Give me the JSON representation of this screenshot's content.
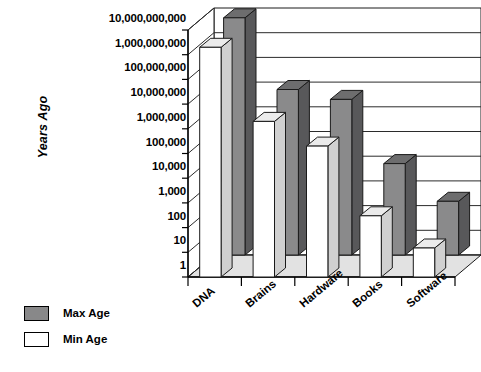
{
  "chart_data": {
    "type": "bar",
    "title": "",
    "subtitle": "",
    "xlabel": "",
    "ylabel": "Years Ago",
    "categories": [
      "DNA",
      "Brains",
      "Hardware",
      "Books",
      "Software"
    ],
    "series": [
      {
        "name": "Max Age",
        "color": "#888889",
        "values": [
          4000000000,
          5000000,
          2000000,
          5000,
          150
        ]
      },
      {
        "name": "Min Age",
        "color": "#ffffff",
        "values": [
          2000000000,
          2000000,
          200000,
          300,
          15
        ]
      }
    ],
    "y_scale": "log10",
    "ylim": [
      1,
      10000000000
    ],
    "y_tick_labels": [
      "10,000,000,000",
      "1,000,000,000",
      "100,000,000",
      "10,000,000",
      "1,000,000",
      "100,000",
      "10,000",
      "1,000",
      "100",
      "10",
      "1"
    ],
    "y_tick_values": [
      10000000000,
      1000000000,
      100000000,
      10000000,
      1000000,
      100000,
      10000,
      1000,
      100,
      10,
      1
    ],
    "grid": true,
    "legend_position": "bottom-left",
    "three_d": true
  },
  "legend": {
    "entries": [
      {
        "label": "Max Age",
        "swatch": "max"
      },
      {
        "label": "Min Age",
        "swatch": "min"
      }
    ]
  },
  "colors": {
    "max_age_front": "#8a8a8b",
    "max_age_top": "#6d6d6e",
    "max_age_side": "#58585a",
    "min_age_front": "#ffffff",
    "min_age_top": "#ebebeb",
    "min_age_side": "#d0d0d0",
    "floor": "#e2e2e2",
    "wall": "#ffffff",
    "outline": "#1a1a1a"
  }
}
